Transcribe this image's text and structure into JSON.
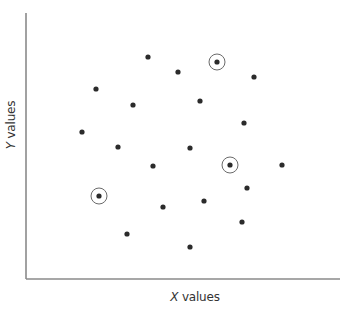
{
  "chart_data": {
    "type": "scatter",
    "title": "",
    "xlabel": "X values",
    "ylabel": "Y values",
    "xlabel_parts": {
      "var": "X",
      "rest": " values"
    },
    "ylabel_parts": {
      "var": "Y",
      "rest": " values"
    },
    "grid": false,
    "legend": null,
    "ticks": false,
    "units_note": "x measured right from Y axis, y measured up from X axis, in plot units (pixels)",
    "xlim": [
      0,
      314
    ],
    "ylim": [
      0,
      266
    ],
    "points": [
      {
        "x": 122,
        "y": 222,
        "highlighted": false
      },
      {
        "x": 152,
        "y": 207,
        "highlighted": false
      },
      {
        "x": 191,
        "y": 217,
        "highlighted": true
      },
      {
        "x": 228,
        "y": 202,
        "highlighted": false
      },
      {
        "x": 70,
        "y": 190,
        "highlighted": false
      },
      {
        "x": 107,
        "y": 174,
        "highlighted": false
      },
      {
        "x": 174,
        "y": 178,
        "highlighted": false
      },
      {
        "x": 56,
        "y": 147,
        "highlighted": false
      },
      {
        "x": 218,
        "y": 156,
        "highlighted": false
      },
      {
        "x": 92,
        "y": 132,
        "highlighted": false
      },
      {
        "x": 164,
        "y": 131,
        "highlighted": false
      },
      {
        "x": 127,
        "y": 113,
        "highlighted": false
      },
      {
        "x": 204,
        "y": 114,
        "highlighted": true
      },
      {
        "x": 256,
        "y": 114,
        "highlighted": false
      },
      {
        "x": 221,
        "y": 91,
        "highlighted": false
      },
      {
        "x": 73,
        "y": 83,
        "highlighted": true
      },
      {
        "x": 178,
        "y": 78,
        "highlighted": false
      },
      {
        "x": 137,
        "y": 72,
        "highlighted": false
      },
      {
        "x": 216,
        "y": 57,
        "highlighted": false
      },
      {
        "x": 101,
        "y": 45,
        "highlighted": false
      },
      {
        "x": 164,
        "y": 32,
        "highlighted": false
      }
    ],
    "colors": {
      "point": "#2b2b2b",
      "ring": "#6a6a6a",
      "axis": "#8a8a8a"
    }
  },
  "plot_box": {
    "origin_x": 26,
    "origin_y": 279,
    "x_end": 340,
    "y_top": 13
  }
}
